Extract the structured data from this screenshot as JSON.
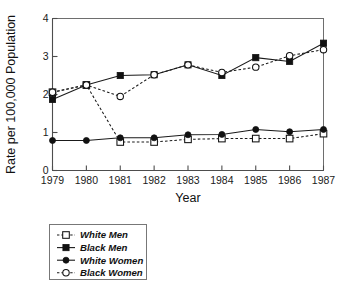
{
  "chart_data": {
    "type": "line",
    "title": "",
    "xlabel": "Year",
    "ylabel": "Rate per 100,000 Population",
    "x": [
      1979,
      1980,
      1981,
      1982,
      1983,
      1984,
      1985,
      1986,
      1987
    ],
    "xticklabels": [
      "1979",
      "1980",
      "1981",
      "1982",
      "1983",
      "1984",
      "1985",
      "1986",
      "1987"
    ],
    "yticklabels": [
      "0",
      "1",
      "2",
      "3",
      "4"
    ],
    "yticks": [
      0,
      1,
      2,
      3,
      4
    ],
    "xlim": [
      1979,
      1987
    ],
    "ylim": [
      0,
      4
    ],
    "grid": false,
    "legend_position": "below-left",
    "series": [
      {
        "name": "White Men",
        "linestyle": "dashed",
        "marker": "open-square",
        "color": "#111111",
        "values": [
          2.06,
          2.25,
          0.75,
          0.75,
          0.82,
          0.84,
          0.84,
          0.84,
          0.97
        ]
      },
      {
        "name": "Black Men",
        "linestyle": "solid",
        "marker": "filled-square",
        "color": "#111111",
        "values": [
          1.87,
          2.25,
          2.5,
          2.52,
          2.78,
          2.5,
          2.97,
          2.87,
          3.35
        ]
      },
      {
        "name": "White Women",
        "linestyle": "solid",
        "marker": "filled-circle",
        "color": "#111111",
        "values": [
          0.79,
          0.79,
          0.86,
          0.86,
          0.94,
          0.95,
          1.08,
          1.02,
          1.08
        ]
      },
      {
        "name": "Black Women",
        "linestyle": "dashed",
        "marker": "open-circle",
        "color": "#111111",
        "values": [
          2.06,
          2.25,
          1.95,
          2.52,
          2.78,
          2.58,
          2.72,
          3.02,
          3.18
        ]
      }
    ],
    "notes": {
      "white_men_1979": "open square plotted at 2.06 overlapping Black Women marker",
      "white_men_1980": "open square plotted at 2.25 overlapping Black Men / Black Women markers",
      "series_count": 4
    }
  },
  "legend": {
    "items": [
      {
        "label": "White Men",
        "marker": "open-square",
        "linestyle": "dashed"
      },
      {
        "label": "Black Men",
        "marker": "filled-square",
        "linestyle": "solid"
      },
      {
        "label": "White Women",
        "marker": "filled-circle",
        "linestyle": "solid"
      },
      {
        "label": "Black Women",
        "marker": "open-circle",
        "linestyle": "dashed"
      }
    ]
  },
  "axes": {
    "x_title": "Year",
    "y_title": "Rate per 100,000 Population"
  }
}
